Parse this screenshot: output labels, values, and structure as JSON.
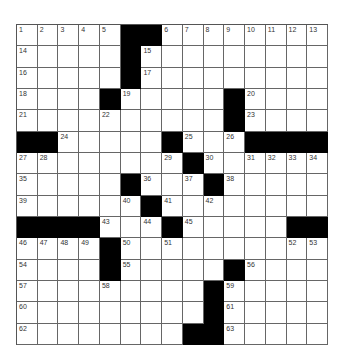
{
  "puzzle": {
    "rows": 15,
    "cols": 15,
    "colors": {
      "block": "#000000",
      "cell": "#ffffff",
      "line": "#666666"
    },
    "blocks": [
      [
        0,
        5
      ],
      [
        0,
        6
      ],
      [
        1,
        5
      ],
      [
        2,
        5
      ],
      [
        3,
        4
      ],
      [
        3,
        10
      ],
      [
        4,
        10
      ],
      [
        5,
        0
      ],
      [
        5,
        1
      ],
      [
        5,
        7
      ],
      [
        5,
        11
      ],
      [
        5,
        12
      ],
      [
        5,
        13
      ],
      [
        5,
        14
      ],
      [
        6,
        8
      ],
      [
        7,
        5
      ],
      [
        7,
        9
      ],
      [
        8,
        6
      ],
      [
        9,
        0
      ],
      [
        9,
        1
      ],
      [
        9,
        2
      ],
      [
        9,
        3
      ],
      [
        9,
        7
      ],
      [
        9,
        13
      ],
      [
        9,
        14
      ],
      [
        10,
        4
      ],
      [
        11,
        4
      ],
      [
        11,
        10
      ],
      [
        12,
        9
      ],
      [
        13,
        9
      ],
      [
        14,
        8
      ],
      [
        14,
        9
      ]
    ],
    "numbers": [
      [
        0,
        0,
        "1"
      ],
      [
        0,
        1,
        "2"
      ],
      [
        0,
        2,
        "3"
      ],
      [
        0,
        3,
        "4"
      ],
      [
        0,
        4,
        "5"
      ],
      [
        0,
        7,
        "6"
      ],
      [
        0,
        8,
        "7"
      ],
      [
        0,
        9,
        "8"
      ],
      [
        0,
        10,
        "9"
      ],
      [
        0,
        11,
        "10"
      ],
      [
        0,
        12,
        "11"
      ],
      [
        0,
        13,
        "12"
      ],
      [
        0,
        14,
        "13"
      ],
      [
        1,
        0,
        "14"
      ],
      [
        1,
        6,
        "15"
      ],
      [
        2,
        0,
        "16"
      ],
      [
        2,
        6,
        "17"
      ],
      [
        3,
        0,
        "18"
      ],
      [
        3,
        5,
        "19"
      ],
      [
        3,
        11,
        "20"
      ],
      [
        4,
        0,
        "21"
      ],
      [
        4,
        4,
        "22"
      ],
      [
        4,
        11,
        "23"
      ],
      [
        5,
        2,
        "24"
      ],
      [
        5,
        8,
        "25"
      ],
      [
        5,
        10,
        "26"
      ],
      [
        6,
        0,
        "27"
      ],
      [
        6,
        1,
        "28"
      ],
      [
        6,
        7,
        "29"
      ],
      [
        6,
        9,
        "30"
      ],
      [
        6,
        11,
        "31"
      ],
      [
        6,
        12,
        "32"
      ],
      [
        6,
        13,
        "33"
      ],
      [
        6,
        14,
        "34"
      ],
      [
        7,
        0,
        "35"
      ],
      [
        7,
        6,
        "36"
      ],
      [
        7,
        8,
        "37"
      ],
      [
        7,
        10,
        "38"
      ],
      [
        8,
        0,
        "39"
      ],
      [
        8,
        5,
        "40"
      ],
      [
        8,
        7,
        "41"
      ],
      [
        8,
        9,
        "42"
      ],
      [
        9,
        4,
        "43"
      ],
      [
        9,
        6,
        "44"
      ],
      [
        9,
        8,
        "45"
      ],
      [
        10,
        0,
        "46"
      ],
      [
        10,
        1,
        "47"
      ],
      [
        10,
        2,
        "48"
      ],
      [
        10,
        3,
        "49"
      ],
      [
        10,
        5,
        "50"
      ],
      [
        10,
        7,
        "51"
      ],
      [
        10,
        13,
        "52"
      ],
      [
        10,
        14,
        "53"
      ],
      [
        11,
        0,
        "54"
      ],
      [
        11,
        5,
        "55"
      ],
      [
        11,
        11,
        "56"
      ],
      [
        12,
        0,
        "57"
      ],
      [
        12,
        4,
        "58"
      ],
      [
        12,
        10,
        "59"
      ],
      [
        13,
        0,
        "60"
      ],
      [
        13,
        10,
        "61"
      ],
      [
        14,
        0,
        "62"
      ],
      [
        14,
        10,
        "63"
      ]
    ]
  }
}
